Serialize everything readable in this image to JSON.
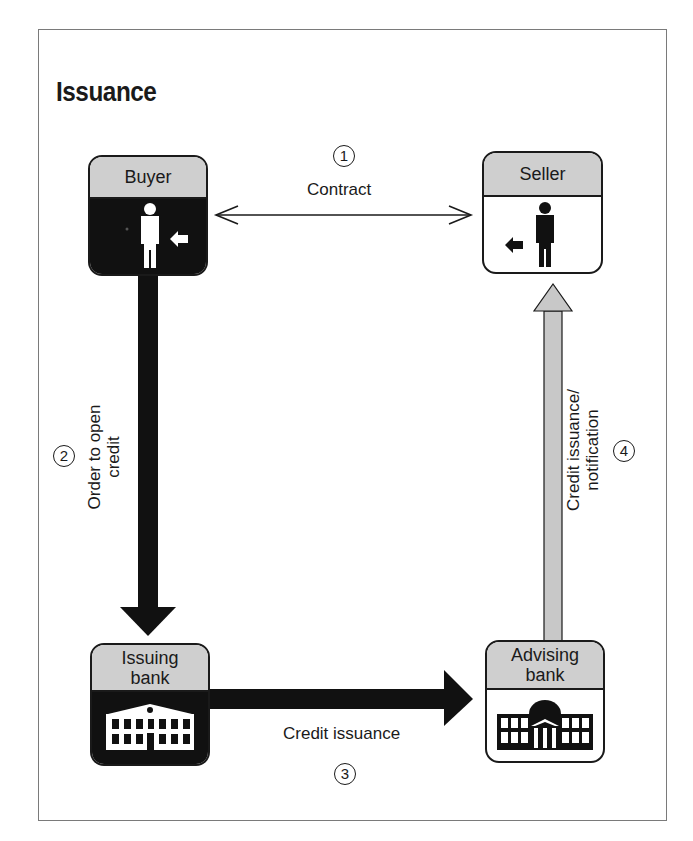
{
  "title": "Issuance",
  "colors": {
    "ink": "#1a1a1a",
    "header_fill": "#cfcfcf",
    "dark_fill": "#111111",
    "light_arrow": "#c8c8c8",
    "frame": "#7a7a7a"
  },
  "nodes": {
    "buyer": {
      "label": "Buyer",
      "style": "dark",
      "icon": "person-icon"
    },
    "seller": {
      "label": "Seller",
      "style": "light",
      "icon": "person-icon"
    },
    "issuing_bank": {
      "label": "Issuing bank",
      "line1": "Issuing",
      "line2": "bank",
      "style": "dark",
      "icon": "bank-building-icon"
    },
    "advising_bank": {
      "label": "Advising bank",
      "line1": "Advising",
      "line2": "bank",
      "style": "light",
      "icon": "domed-bank-icon"
    }
  },
  "flows": [
    {
      "step": "1",
      "label": "Contract",
      "from": "buyer",
      "to": "seller",
      "type": "double-headed thin arrow"
    },
    {
      "step": "2",
      "label": "Order to open credit",
      "line1": "Order to open",
      "line2": "credit",
      "from": "buyer",
      "to": "issuing_bank",
      "type": "thick dark arrow"
    },
    {
      "step": "3",
      "label": "Credit issuance",
      "from": "issuing_bank",
      "to": "advising_bank",
      "type": "thick dark arrow"
    },
    {
      "step": "4",
      "label": "Credit issuance/ notification",
      "line1": "Credit issuance/",
      "line2": "notification",
      "from": "advising_bank",
      "to": "seller",
      "type": "thick light arrow"
    }
  ]
}
